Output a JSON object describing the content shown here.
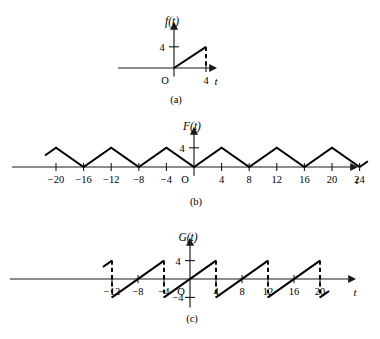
{
  "figure": {
    "background": "#ffffff",
    "ink_color": "#000000",
    "width": 380,
    "height": 339
  },
  "chart_data": [
    {
      "id": "panel-a",
      "type": "line",
      "title": "",
      "caption": "(a)",
      "ylabel": "f(t)",
      "xlabel": "t",
      "origin_label": "O",
      "x_ticks": [
        4
      ],
      "x_tick_labels": [
        "4"
      ],
      "y_ticks": [
        4
      ],
      "y_tick_labels": [
        "4"
      ],
      "xlim": [
        -4,
        7
      ],
      "ylim": [
        -1.6,
        5.6
      ],
      "grid": false,
      "legend": null,
      "series": [
        {
          "name": "f(t)",
          "style": "solid",
          "x": [
            0,
            4
          ],
          "values": [
            0,
            4
          ]
        }
      ],
      "dashed_drops": [
        {
          "x": 4,
          "y_from": 4,
          "y_to": 0
        }
      ],
      "description": "Ramp from origin rising linearly to (4,4) with dashed vertical line down to axis at t=4."
    },
    {
      "id": "panel-b",
      "type": "line",
      "title": "",
      "caption": "(b)",
      "ylabel": "F(t)",
      "xlabel": "t",
      "origin_label": "O",
      "x_ticks": [
        -20,
        -16,
        -12,
        -8,
        -4,
        4,
        8,
        12,
        16,
        20,
        24
      ],
      "x_tick_labels": [
        "-20",
        "-16",
        "-12",
        "-8",
        "-4",
        "4",
        "8",
        "12",
        "16",
        "20",
        "24"
      ],
      "y_ticks": [
        4
      ],
      "y_tick_labels": [
        "4"
      ],
      "xlim": [
        -22.5,
        28
      ],
      "ylim": [
        -1.8,
        5.6
      ],
      "grid": false,
      "legend": null,
      "period": 8,
      "amplitude": 4,
      "series": [
        {
          "name": "F(t)",
          "style": "solid",
          "x": [
            -21.6,
            -20,
            -16,
            -12,
            -8,
            -4,
            0,
            4,
            8,
            12,
            16,
            20,
            24,
            25.2
          ],
          "values": [
            2.4,
            4,
            0,
            4,
            0,
            4,
            0,
            4,
            0,
            4,
            0,
            4,
            0,
            1.2
          ]
        }
      ],
      "dashed_drops": [],
      "description": "Triangular wave of period 8 with peaks value 4 at t = -20,-12,-4,4,12,20 and zeros at t = -16,-8,0,8,16,24."
    },
    {
      "id": "panel-c",
      "type": "line",
      "title": "",
      "caption": "(c)",
      "ylabel": "G(t)",
      "xlabel": "t",
      "origin_label": "O",
      "x_ticks": [
        -12,
        -8,
        -4,
        4,
        8,
        12,
        16,
        20
      ],
      "x_tick_labels": [
        "-12",
        "-8",
        "-4",
        "4",
        "8",
        "12",
        "16",
        "20"
      ],
      "y_ticks": [
        4,
        -4
      ],
      "y_tick_labels": [
        "4",
        "-4"
      ],
      "xlim": [
        -16,
        28
      ],
      "ylim": [
        -6.2,
        6.2
      ],
      "grid": false,
      "legend": null,
      "period": 8,
      "amplitude": 4,
      "series": [
        {
          "name": "G(t)",
          "style": "sawtooth",
          "segments": [
            {
              "x": [
                -13.4,
                -12
              ],
              "values": [
                2.6,
                4
              ]
            },
            {
              "x": [
                -12,
                -4
              ],
              "values": [
                -4,
                4
              ]
            },
            {
              "x": [
                -4,
                4
              ],
              "values": [
                -4,
                4
              ]
            },
            {
              "x": [
                4,
                12
              ],
              "values": [
                -4,
                4
              ]
            },
            {
              "x": [
                12,
                20
              ],
              "values": [
                -4,
                4
              ]
            },
            {
              "x": [
                20,
                21.4
              ],
              "values": [
                -4,
                -2.6
              ]
            }
          ]
        }
      ],
      "dashed_drops": [
        {
          "x": -12,
          "y_from": 4,
          "y_to": -4
        },
        {
          "x": -4,
          "y_from": 4,
          "y_to": -4
        },
        {
          "x": 4,
          "y_from": 4,
          "y_to": -4
        },
        {
          "x": 12,
          "y_from": 4,
          "y_to": -4
        },
        {
          "x": 20,
          "y_from": 4,
          "y_to": -4
        }
      ],
      "description": "Sawtooth wave of period 8 ramping from -4 to 4, zero crossings at t = -8,0,8,16, dashed vertical drops at t = -12,-4,4,12,20."
    }
  ]
}
